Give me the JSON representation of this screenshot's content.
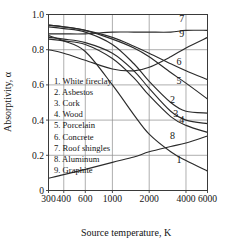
{
  "chart_data": {
    "type": "line",
    "title": "",
    "xlabel": "Source temperature, K",
    "ylabel": "Absorptivity, α",
    "xscale": "log",
    "xlim": [
      300,
      6000
    ],
    "ylim": [
      0,
      1.0
    ],
    "grid": true,
    "legend_position": "inside-left",
    "xticks": [
      300,
      400,
      600,
      1000,
      2000,
      4000,
      6000
    ],
    "xtick_labels": [
      "300",
      "400",
      "600",
      "1000",
      "2000",
      "4000",
      "6000"
    ],
    "yticks": [
      0,
      0.2,
      0.4,
      0.6,
      0.8,
      1.0
    ],
    "ytick_labels": [
      "0",
      "0.2",
      "0.4",
      "0.6",
      "0.8",
      "1.0"
    ],
    "series": [
      {
        "id": "1",
        "name": "White fireclay",
        "label": "1",
        "x": [
          300,
          400,
          600,
          1000,
          1500,
          2000,
          3000,
          4000,
          6000
        ],
        "y": [
          0.88,
          0.85,
          0.79,
          0.6,
          0.43,
          0.32,
          0.22,
          0.17,
          0.11
        ]
      },
      {
        "id": "2",
        "name": "Asbestos",
        "label": "2",
        "x": [
          300,
          400,
          600,
          1000,
          1500,
          2000,
          3000,
          4000,
          6000
        ],
        "y": [
          0.93,
          0.92,
          0.9,
          0.83,
          0.72,
          0.62,
          0.5,
          0.45,
          0.44
        ]
      },
      {
        "id": "3",
        "name": "Cork",
        "label": "3",
        "x": [
          300,
          400,
          600,
          1000,
          1500,
          2000,
          3000,
          4000,
          6000
        ],
        "y": [
          0.87,
          0.86,
          0.84,
          0.78,
          0.68,
          0.58,
          0.45,
          0.4,
          0.38
        ]
      },
      {
        "id": "4",
        "name": "Wood",
        "label": "4",
        "x": [
          300,
          400,
          600,
          1000,
          1500,
          2000,
          3000,
          4000,
          6000
        ],
        "y": [
          0.86,
          0.85,
          0.83,
          0.75,
          0.64,
          0.54,
          0.42,
          0.37,
          0.33
        ]
      },
      {
        "id": "5",
        "name": "Porcelain",
        "label": "5",
        "x": [
          300,
          400,
          600,
          1000,
          1500,
          2000,
          3000,
          4000,
          6000
        ],
        "y": [
          0.94,
          0.93,
          0.91,
          0.86,
          0.81,
          0.76,
          0.67,
          0.61,
          0.52
        ]
      },
      {
        "id": "6",
        "name": "Concrete",
        "label": "6",
        "x": [
          300,
          400,
          600,
          1000,
          1500,
          2000,
          3000,
          4000,
          6000
        ],
        "y": [
          0.94,
          0.93,
          0.91,
          0.87,
          0.82,
          0.78,
          0.72,
          0.68,
          0.63
        ]
      },
      {
        "id": "7",
        "name": "Roof shingles",
        "label": "7",
        "x": [
          300,
          400,
          600,
          1000,
          1500,
          2000,
          3000,
          4000,
          6000
        ],
        "y": [
          0.89,
          0.89,
          0.89,
          0.9,
          0.9,
          0.9,
          0.9,
          0.91,
          0.91
        ]
      },
      {
        "id": "8",
        "name": "Aluminum",
        "label": "8",
        "x": [
          300,
          400,
          600,
          1000,
          1500,
          2000,
          3000,
          4000,
          6000
        ],
        "y": [
          0.07,
          0.09,
          0.12,
          0.16,
          0.19,
          0.22,
          0.25,
          0.27,
          0.31
        ]
      },
      {
        "id": "9",
        "name": "Graphite",
        "label": "9",
        "x": [
          300,
          400,
          600,
          1000,
          1500,
          2000,
          3000,
          4000,
          6000
        ],
        "y": [
          0.8,
          0.78,
          0.74,
          0.69,
          0.68,
          0.7,
          0.76,
          0.81,
          0.87
        ]
      }
    ],
    "legend_entries": [
      "1. White fireclay",
      "2. Asbestos",
      "3. Cork",
      "4. Wood",
      "5. Porcelain",
      "6. Concrete",
      "7. Roof shingles",
      "8. Aluminum",
      "9. Graphite"
    ],
    "curve_labels": [
      {
        "text": "7",
        "x": 3700,
        "y": 0.955
      },
      {
        "text": "9",
        "x": 3700,
        "y": 0.875
      },
      {
        "text": "6",
        "x": 3500,
        "y": 0.715
      },
      {
        "text": "5",
        "x": 3500,
        "y": 0.605
      },
      {
        "text": "2",
        "x": 3100,
        "y": 0.495
      },
      {
        "text": "3",
        "x": 3300,
        "y": 0.415
      },
      {
        "text": "4",
        "x": 3700,
        "y": 0.385
      },
      {
        "text": "8",
        "x": 3100,
        "y": 0.295
      },
      {
        "text": "1",
        "x": 3500,
        "y": 0.155
      }
    ]
  }
}
